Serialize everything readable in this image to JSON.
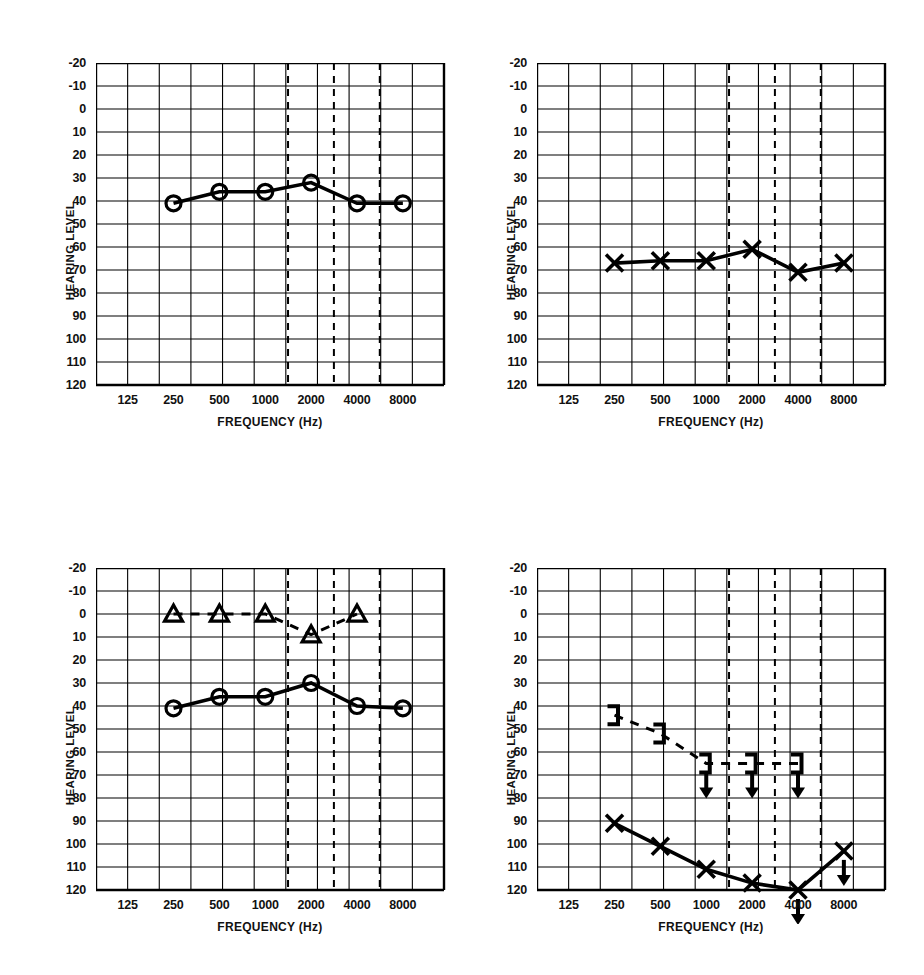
{
  "figure": {
    "width": 924,
    "height": 975,
    "background": "#ffffff",
    "ink": "#000000"
  },
  "axis": {
    "ylabel": "HEARING LEVEL",
    "xlabel": "FREQUENCY (Hz)",
    "yticks": [
      "-20",
      "-10",
      "0",
      "10",
      "20",
      "30",
      "40",
      "50",
      "60",
      "70",
      "80",
      "90",
      "100",
      "110",
      "120"
    ],
    "ytick_values": [
      -20,
      -10,
      0,
      10,
      20,
      30,
      40,
      50,
      60,
      70,
      80,
      90,
      100,
      110,
      120
    ],
    "ylim": [
      -20,
      120
    ],
    "xticks": [
      "125",
      "250",
      "500",
      "1000",
      "2000",
      "4000",
      "8000"
    ],
    "xtick_values": [
      125,
      250,
      500,
      1000,
      2000,
      4000,
      8000
    ],
    "minor_dashed_ticks": [
      1500,
      3000,
      6000
    ],
    "grid": "on"
  },
  "chart_data": [
    {
      "id": "panel-top-left",
      "type": "line",
      "title": "",
      "xlabel": "FREQUENCY (Hz)",
      "ylabel": "HEARING LEVEL",
      "ylim": [
        -20,
        120
      ],
      "grid": true,
      "legend": "none",
      "series": [
        {
          "name": "right-ear-air-conduction",
          "marker": "circle",
          "line": "solid",
          "x": [
            250,
            500,
            1000,
            2000,
            4000,
            8000
          ],
          "values": [
            41,
            36,
            36,
            32,
            41,
            41
          ]
        }
      ]
    },
    {
      "id": "panel-top-right",
      "type": "line",
      "title": "",
      "xlabel": "FREQUENCY (Hz)",
      "ylabel": "HEARING LEVEL",
      "ylim": [
        -20,
        120
      ],
      "grid": true,
      "legend": "none",
      "series": [
        {
          "name": "left-ear-air-conduction",
          "marker": "cross",
          "line": "solid",
          "x": [
            250,
            500,
            1000,
            2000,
            4000,
            8000
          ],
          "values": [
            67,
            66,
            66,
            61,
            71,
            67
          ]
        }
      ]
    },
    {
      "id": "panel-bottom-left",
      "type": "line",
      "title": "",
      "xlabel": "FREQUENCY (Hz)",
      "ylabel": "HEARING LEVEL",
      "ylim": [
        -20,
        120
      ],
      "grid": true,
      "legend": "none",
      "series": [
        {
          "name": "masked-bone-conduction",
          "marker": "triangle",
          "line": "dashed",
          "x": [
            250,
            500,
            1000,
            2000,
            4000
          ],
          "values": [
            0,
            0,
            0,
            9,
            0
          ]
        },
        {
          "name": "right-ear-air-conduction",
          "marker": "circle",
          "line": "solid",
          "x": [
            250,
            500,
            1000,
            2000,
            4000,
            8000
          ],
          "values": [
            41,
            36,
            36,
            30,
            40,
            41
          ]
        }
      ]
    },
    {
      "id": "panel-bottom-right",
      "type": "line",
      "title": "",
      "xlabel": "FREQUENCY (Hz)",
      "ylabel": "HEARING LEVEL",
      "ylim": [
        -20,
        120
      ],
      "grid": true,
      "legend": "none",
      "series": [
        {
          "name": "masked-bone-conduction-left",
          "marker": "bracket-right",
          "line": "dashed",
          "x": [
            250,
            500,
            1000,
            2000,
            4000
          ],
          "values": [
            44,
            52,
            65,
            65,
            65
          ],
          "no_response": [
            false,
            false,
            true,
            true,
            true
          ]
        },
        {
          "name": "left-ear-air-conduction",
          "marker": "cross",
          "line": "solid",
          "x": [
            250,
            500,
            1000,
            2000,
            4000,
            8000
          ],
          "values": [
            91,
            101,
            111,
            117,
            120,
            103
          ],
          "no_response": [
            false,
            false,
            false,
            false,
            true,
            true
          ]
        }
      ]
    }
  ]
}
